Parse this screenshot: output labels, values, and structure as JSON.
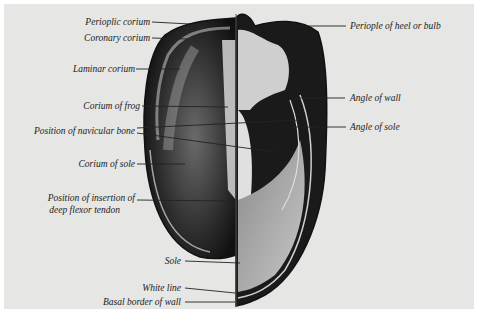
{
  "figure": {
    "background_color": "#e6e6e4",
    "ink_color": "#1a1a1a"
  },
  "labels_left": [
    {
      "id": "perioplic-corium",
      "text": "Perioplic corium"
    },
    {
      "id": "coronary-corium",
      "text": "Coronary corium"
    },
    {
      "id": "laminar-corium",
      "text": "Laminar corium"
    },
    {
      "id": "corium-of-frog",
      "text": "Corium of frog"
    },
    {
      "id": "position-navicular-bone",
      "text": "Position of navicular bone"
    },
    {
      "id": "corium-of-sole",
      "text": "Corium of sole"
    },
    {
      "id": "insertion-line1",
      "text": "Position of insertion of"
    },
    {
      "id": "insertion-line2",
      "text": "deep flexor tendon"
    },
    {
      "id": "sole",
      "text": "Sole"
    },
    {
      "id": "white-line",
      "text": "White line"
    },
    {
      "id": "basal-border",
      "text": "Basal border of wall"
    }
  ],
  "labels_right": [
    {
      "id": "periople-heel",
      "text": "Periople of heel or bulb"
    },
    {
      "id": "angle-of-wall",
      "text": "Angle of wall"
    },
    {
      "id": "angle-of-sole",
      "text": "Angle of sole"
    }
  ]
}
